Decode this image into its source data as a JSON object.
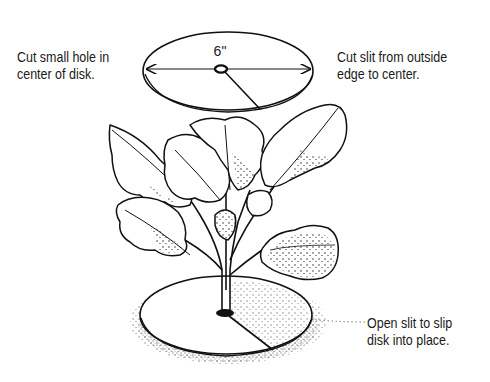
{
  "diagram": {
    "top_disk": {
      "dimension_label": "6\"",
      "annotations": {
        "left": [
          "Cut small hole in",
          "center of disk."
        ],
        "right": [
          "Cut slit from outside",
          "edge to center."
        ]
      }
    },
    "bottom_disk": {
      "annotation": [
        "Open slit to slip",
        "disk into place."
      ]
    },
    "colors": {
      "ink": "#111111",
      "background": "#ffffff"
    }
  }
}
